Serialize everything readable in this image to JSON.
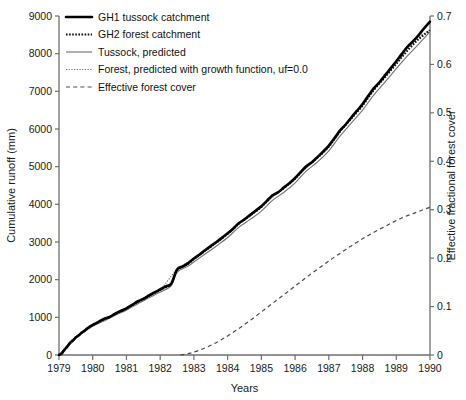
{
  "chart_data": {
    "type": "line",
    "title": "",
    "xlabel": "Years",
    "ylabel": "Cumulative runoff (mm)",
    "y2label": "Effective fractional forest cover",
    "xlim": [
      1979,
      1990
    ],
    "ylim": [
      0,
      9000
    ],
    "y2lim": [
      0,
      0.7
    ],
    "grid": false,
    "legend_position": "top-left",
    "xticks": [
      "1979",
      "1980",
      "1981",
      "1982",
      "1983",
      "1984",
      "1985",
      "1986",
      "1987",
      "1988",
      "1989",
      "1990"
    ],
    "yticks": [
      "0",
      "1000",
      "2000",
      "3000",
      "4000",
      "5000",
      "6000",
      "7000",
      "8000",
      "9000"
    ],
    "y2ticks": [
      "0",
      "0.1",
      "0.2",
      "0.3",
      "0.4",
      "0.5",
      "0.6",
      "0.7"
    ],
    "series": [
      {
        "name": "GH1 tussock catchment",
        "style": "thick-solid",
        "color": "#000000",
        "axis": "left",
        "x": [
          1979.0,
          1979.08,
          1979.17,
          1979.25,
          1979.33,
          1979.42,
          1979.5,
          1979.58,
          1979.67,
          1979.75,
          1979.83,
          1979.92,
          1980.0,
          1980.17,
          1980.33,
          1980.5,
          1980.67,
          1980.83,
          1981.0,
          1981.17,
          1981.33,
          1981.5,
          1981.67,
          1981.83,
          1982.0,
          1982.17,
          1982.33,
          1982.5,
          1982.67,
          1982.83,
          1983.0,
          1983.17,
          1983.33,
          1983.5,
          1983.67,
          1983.83,
          1984.0,
          1984.17,
          1984.33,
          1984.5,
          1984.67,
          1984.83,
          1985.0,
          1985.17,
          1985.33,
          1985.5,
          1985.67,
          1985.83,
          1986.0,
          1986.17,
          1986.33,
          1986.5,
          1986.67,
          1986.83,
          1987.0,
          1987.17,
          1987.33,
          1987.5,
          1987.67,
          1987.83,
          1988.0,
          1988.17,
          1988.33,
          1988.5,
          1988.67,
          1988.83,
          1989.0,
          1989.17,
          1989.33,
          1989.5,
          1989.67,
          1989.83,
          1990.0
        ],
        "y": [
          0,
          40,
          150,
          230,
          330,
          390,
          470,
          520,
          590,
          640,
          700,
          760,
          800,
          880,
          960,
          1010,
          1100,
          1170,
          1240,
          1330,
          1420,
          1490,
          1580,
          1660,
          1740,
          1820,
          1900,
          2270,
          2350,
          2440,
          2560,
          2670,
          2780,
          2890,
          3000,
          3110,
          3230,
          3360,
          3500,
          3600,
          3720,
          3830,
          3950,
          4100,
          4240,
          4320,
          4450,
          4560,
          4700,
          4860,
          5010,
          5120,
          5260,
          5400,
          5560,
          5760,
          5960,
          6120,
          6310,
          6480,
          6660,
          6880,
          7080,
          7240,
          7430,
          7610,
          7800,
          8000,
          8180,
          8330,
          8500,
          8680,
          8850
        ]
      },
      {
        "name": "GH2 forest catchment",
        "style": "bold-dotted",
        "color": "#0d0d0d",
        "axis": "left",
        "x": [
          1979.0,
          1979.17,
          1979.33,
          1979.5,
          1979.67,
          1979.83,
          1980.0,
          1980.33,
          1980.67,
          1981.0,
          1981.33,
          1981.67,
          1982.0,
          1982.33,
          1982.5,
          1982.83,
          1983.0,
          1983.33,
          1983.67,
          1984.0,
          1984.33,
          1984.67,
          1985.0,
          1985.33,
          1985.67,
          1986.0,
          1986.33,
          1986.67,
          1987.0,
          1987.33,
          1987.67,
          1988.0,
          1988.33,
          1988.67,
          1989.0,
          1989.33,
          1989.67,
          1990.0
        ],
        "y": [
          0,
          140,
          320,
          460,
          580,
          690,
          790,
          945,
          1090,
          1230,
          1405,
          1570,
          1730,
          1890,
          2250,
          2425,
          2545,
          2765,
          2985,
          3215,
          3485,
          3705,
          3930,
          4220,
          4430,
          4680,
          4990,
          5240,
          5530,
          5930,
          6280,
          6620,
          7030,
          7380,
          7730,
          8080,
          8390,
          8620
        ]
      },
      {
        "name": "Tussock, predicted",
        "style": "thin-solid",
        "color": "#707070",
        "axis": "left",
        "x": [
          1979.0,
          1979.25,
          1979.5,
          1979.75,
          1980.0,
          1980.33,
          1980.67,
          1981.0,
          1981.33,
          1981.67,
          1982.0,
          1982.33,
          1982.5,
          1982.83,
          1983.0,
          1983.33,
          1983.67,
          1984.0,
          1984.33,
          1984.67,
          1985.0,
          1985.33,
          1985.67,
          1986.0,
          1986.33,
          1986.67,
          1987.0,
          1987.33,
          1987.67,
          1988.0,
          1988.33,
          1988.67,
          1989.0,
          1989.33,
          1989.67,
          1990.0
        ],
        "y": [
          0,
          210,
          440,
          620,
          760,
          905,
          1055,
          1190,
          1355,
          1520,
          1670,
          1840,
          2190,
          2360,
          2470,
          2680,
          2895,
          3120,
          3390,
          3600,
          3820,
          4105,
          4320,
          4570,
          4880,
          5130,
          5420,
          5810,
          6160,
          6500,
          6900,
          7250,
          7600,
          7940,
          8260,
          8580
        ]
      },
      {
        "name": "Forest, predicted with growth function, uf=0.0",
        "style": "fine-dotted",
        "color": "#5a5a5a",
        "axis": "left",
        "x": [
          1979.0,
          1979.5,
          1980.0,
          1980.5,
          1981.0,
          1981.5,
          1982.0,
          1982.5,
          1983.0,
          1983.5,
          1984.0,
          1984.5,
          1985.0,
          1985.5,
          1986.0,
          1986.5,
          1987.0,
          1987.5,
          1988.0,
          1988.5,
          1989.0,
          1989.5,
          1990.0
        ],
        "y": [
          0,
          470,
          790,
          1030,
          1235,
          1480,
          1740,
          2265,
          2550,
          2900,
          3220,
          3600,
          3940,
          4320,
          4690,
          5110,
          5530,
          6120,
          6640,
          7230,
          7740,
          8320,
          8630
        ]
      },
      {
        "name": "Effective forest cover",
        "style": "dashed",
        "color": "#4a4a4a",
        "axis": "right",
        "x": [
          1982.6,
          1982.9,
          1983.2,
          1983.5,
          1983.8,
          1984.1,
          1984.4,
          1984.7,
          1985.0,
          1985.3,
          1985.6,
          1985.9,
          1986.2,
          1986.5,
          1986.8,
          1987.1,
          1987.4,
          1987.7,
          1988.0,
          1988.3,
          1988.6,
          1988.9,
          1989.2,
          1989.5,
          1989.8,
          1990.0
        ],
        "y": [
          0.0,
          0.004,
          0.011,
          0.02,
          0.031,
          0.044,
          0.058,
          0.073,
          0.089,
          0.105,
          0.121,
          0.137,
          0.153,
          0.169,
          0.184,
          0.199,
          0.213,
          0.227,
          0.24,
          0.252,
          0.263,
          0.274,
          0.284,
          0.292,
          0.3,
          0.305
        ]
      }
    ]
  },
  "legend": {
    "items": [
      {
        "label": "GH1 tussock catchment"
      },
      {
        "label": "GH2 forest catchment"
      },
      {
        "label": "Tussock, predicted"
      },
      {
        "label": "Forest, predicted with growth function, uf=0.0"
      },
      {
        "label": "Effective forest cover"
      }
    ]
  }
}
